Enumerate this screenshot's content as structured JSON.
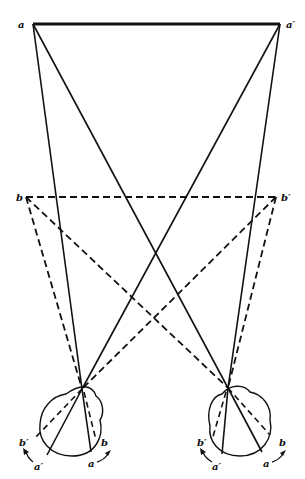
{
  "diagram": {
    "type": "binocular-vision-geometry",
    "colors": {
      "ink": "#111111",
      "background": "#ffffff"
    },
    "points": {
      "a": {
        "label": "a",
        "x": 33,
        "y": 24
      },
      "a_prime": {
        "label": "a′",
        "x": 280,
        "y": 24
      },
      "b": {
        "label": "b",
        "x": 26,
        "y": 197
      },
      "b_prime": {
        "label": "b′",
        "x": 276,
        "y": 197
      }
    },
    "eyes": [
      {
        "name": "left-eye",
        "node": {
          "x": 82,
          "y": 389
        },
        "retina_labels": {
          "b_prime": "b′",
          "a_prime": "a′",
          "a": "a",
          "b": "b"
        }
      },
      {
        "name": "right-eye",
        "node": {
          "x": 228,
          "y": 388
        },
        "retina_labels": {
          "b_prime": "b′",
          "a_prime": "a′",
          "a": "a",
          "b": "b"
        }
      }
    ],
    "lines": {
      "a_line": "solid",
      "b_line": "dashed"
    }
  }
}
